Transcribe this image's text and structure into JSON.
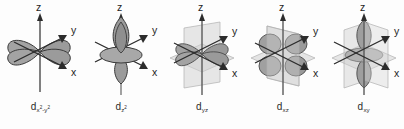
{
  "figure": {
    "background_color": "#fdfdfd",
    "width": 404,
    "height": 129
  },
  "colors": {
    "lobe_fill": "#a3a3a3",
    "lobe_fill_light": "#b4b4b4",
    "lobe_outline": "#3a3a3a",
    "plane_fill": "#cfcfcf",
    "plane_outline": "#b0b0b0",
    "axis_line": "#4a4a4a",
    "axis_label": "#1f1f1f",
    "orbital_label": "#2b2b2b"
  },
  "axes": {
    "z_label": "z",
    "y_label": "y",
    "x_label": "x"
  },
  "orbitals": [
    {
      "id": "dx2-y2",
      "label_base": "d",
      "sub_main": "x",
      "sub_sup1": "2",
      "sub_mid": "-y",
      "sub_sup2": "2",
      "name": "d x squared minus y squared orbital",
      "lobe_arrangement": "four-lobes-along-x-and-y",
      "planes": 0
    },
    {
      "id": "dz2",
      "label_base": "d",
      "sub_main": "z",
      "sub_sup1": "2",
      "sub_mid": "",
      "sub_sup2": "",
      "name": "d z squared orbital",
      "lobe_arrangement": "two-lobes-along-z-with-torus",
      "planes": 0
    },
    {
      "id": "dyz",
      "label_base": "d",
      "sub_main": "yz",
      "sub_sup1": "",
      "sub_mid": "",
      "sub_sup2": "",
      "name": "d y z orbital",
      "lobe_arrangement": "four-lobes-between-y-and-z",
      "planes": 2
    },
    {
      "id": "dxz",
      "label_base": "d",
      "sub_main": "xz",
      "sub_sup1": "",
      "sub_mid": "",
      "sub_sup2": "",
      "name": "d x z orbital",
      "lobe_arrangement": "four-lobes-between-x-and-z",
      "planes": 2
    },
    {
      "id": "dxy",
      "label_base": "d",
      "sub_main": "xy",
      "sub_sup1": "",
      "sub_mid": "",
      "sub_sup2": "",
      "name": "d x y orbital",
      "lobe_arrangement": "four-lobes-between-x-and-y",
      "planes": 2
    }
  ]
}
